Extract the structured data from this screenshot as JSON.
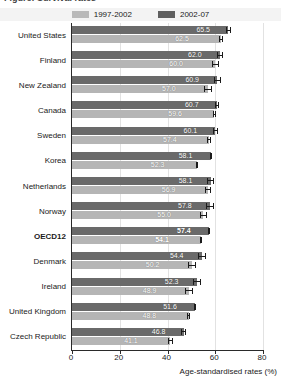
{
  "title": "Figure: Survival rates",
  "legend": {
    "items": [
      {
        "label": "1997-2002",
        "color": "#b9b9b9",
        "key": "s1997"
      },
      {
        "label": "2002-07",
        "color": "#5f5f5f",
        "key": "s2002"
      }
    ]
  },
  "axis": {
    "xlabel": "Age-standardised rates (%)",
    "ticks": [
      "0",
      "20",
      "40",
      "60",
      "80"
    ]
  },
  "chart_data": {
    "type": "bar",
    "orientation": "horizontal",
    "title": "",
    "xlabel": "Age-standardised rates (%)",
    "ylabel": "",
    "xlim": [
      0,
      80
    ],
    "xticks": [
      0,
      20,
      40,
      60,
      80
    ],
    "grid": true,
    "legend_position": "top-center",
    "categories": [
      "United States",
      "Finland",
      "New Zealand",
      "Canada",
      "Sweden",
      "Korea",
      "Netherlands",
      "Norway",
      "OECD12",
      "Denmark",
      "Ireland",
      "United Kingdom",
      "Czech Republic"
    ],
    "highlight_category": "OECD12",
    "series": [
      {
        "name": "2002-07",
        "color": "#6a6a6a",
        "values": [
          65.5,
          62.0,
          60.9,
          60.7,
          60.1,
          58.1,
          58.1,
          57.8,
          57.4,
          54.4,
          52.3,
          51.6,
          46.8
        ],
        "errors_low": [
          64.6,
          60.6,
          59.3,
          60.0,
          59.2,
          57.6,
          56.7,
          56.3,
          57.0,
          52.6,
          50.6,
          51.1,
          45.7
        ],
        "errors_high": [
          66.4,
          63.4,
          62.5,
          61.4,
          61.0,
          58.6,
          59.5,
          59.3,
          57.8,
          56.2,
          54.0,
          52.1,
          47.9
        ]
      },
      {
        "name": "1997-2002",
        "color": "#b5b5b5",
        "values": [
          62.5,
          60.0,
          57.0,
          59.6,
          57.4,
          52.3,
          56.9,
          55.0,
          54.1,
          50.2,
          48.9,
          48.8,
          41.1
        ],
        "errors_low": [
          61.6,
          58.6,
          55.4,
          58.9,
          56.5,
          51.8,
          55.5,
          53.5,
          53.7,
          48.4,
          47.2,
          48.3,
          40.0
        ],
        "errors_high": [
          63.4,
          61.4,
          58.6,
          60.3,
          58.3,
          52.8,
          58.3,
          56.5,
          54.5,
          52.0,
          50.6,
          49.3,
          42.2
        ]
      }
    ]
  }
}
